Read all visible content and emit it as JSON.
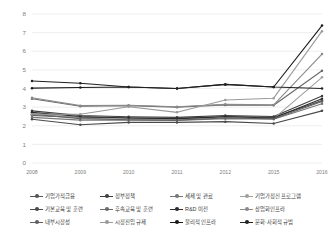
{
  "chart_data": {
    "type": "line",
    "title": "",
    "subtitle": "",
    "xlabel": "",
    "ylabel": "",
    "x": [
      "2008",
      "2009",
      "2010",
      "2011",
      "2012",
      "2015",
      "2016"
    ],
    "categories": [
      "2008",
      "2009",
      "2010",
      "2011",
      "2012",
      "2015",
      "2016"
    ],
    "ylim": [
      0,
      8
    ],
    "yticks": [
      0,
      1,
      2,
      3,
      4,
      5,
      6,
      7,
      8
    ],
    "ytick_labels": [
      "0",
      "1",
      "2",
      "3",
      "4",
      "5",
      "6",
      "7",
      "8"
    ],
    "grid": true,
    "grid_axis": "y",
    "legend_position": "bottom",
    "legend_columns": 4,
    "markers": true,
    "series": [
      {
        "name": "기업가적금융",
        "color": "#555555",
        "values": [
          2.55,
          2.45,
          2.42,
          2.38,
          2.5,
          2.45,
          3.35
        ]
      },
      {
        "name": "정부정책",
        "color": "#3f3f3f",
        "values": [
          2.8,
          2.55,
          2.48,
          2.45,
          2.55,
          2.5,
          3.6
        ]
      },
      {
        "name": "세제 및 관료",
        "color": "#777777",
        "values": [
          2.45,
          2.3,
          2.3,
          2.28,
          2.38,
          2.35,
          3.18
        ]
      },
      {
        "name": "기업가정신 프로그램",
        "color": "#a0a0a0",
        "values": [
          2.65,
          2.42,
          2.35,
          2.35,
          2.42,
          2.38,
          4.6
        ]
      },
      {
        "name": "기본교육 및 훈련",
        "color": "#4a4a4a",
        "values": [
          2.35,
          2.05,
          2.18,
          2.18,
          2.22,
          2.12,
          2.8
        ]
      },
      {
        "name": "후속교육 및 훈련",
        "color": "#6a6a6a",
        "values": [
          3.45,
          3.05,
          3.08,
          3.0,
          3.12,
          3.1,
          4.95
        ]
      },
      {
        "name": "R&D 이전",
        "color": "#2b2b2b",
        "values": [
          2.72,
          2.5,
          2.42,
          2.38,
          2.48,
          2.42,
          3.45
        ]
      },
      {
        "name": "상업화인프라",
        "color": "#8a8a8a",
        "values": [
          3.5,
          3.08,
          3.1,
          3.02,
          3.15,
          3.12,
          5.85
        ]
      },
      {
        "name": "내부시장성",
        "color": "#606060",
        "values": [
          2.62,
          2.38,
          2.32,
          2.3,
          2.42,
          2.38,
          3.3
        ]
      },
      {
        "name": "시장진입 규제",
        "color": "#9a9a9a",
        "values": [
          2.62,
          2.62,
          3.02,
          2.72,
          3.38,
          3.48,
          7.08
        ]
      },
      {
        "name": "물리적 인프라",
        "color": "#1a1a1a",
        "values": [
          4.02,
          4.05,
          4.08,
          4.0,
          4.22,
          4.08,
          7.38
        ]
      },
      {
        "name": "문화·사회적 규범",
        "color": "#222222",
        "values": [
          4.4,
          4.28,
          4.08,
          4.0,
          4.22,
          4.08,
          4.0
        ]
      }
    ]
  },
  "legend": {
    "rows": [
      [
        {
          "label": "기업가적금융",
          "color": "#555555"
        },
        {
          "label": "정부정책",
          "color": "#3f3f3f"
        },
        {
          "label": "세제 및 관료",
          "color": "#777777"
        },
        {
          "label": "기업가정신 프로그램",
          "color": "#a0a0a0"
        }
      ],
      [
        {
          "label": "기본교육 및 훈련",
          "color": "#4a4a4a"
        },
        {
          "label": "후속교육 및 훈련",
          "color": "#6a6a6a"
        },
        {
          "label": "R&D 이전",
          "color": "#2b2b2b"
        },
        {
          "label": "상업화인프라",
          "color": "#8a8a8a"
        }
      ],
      [
        {
          "label": "내부시장성",
          "color": "#606060"
        },
        {
          "label": "시장진입 규제",
          "color": "#9a9a9a"
        },
        {
          "label": "물리적 인프라",
          "color": "#1a1a1a"
        },
        {
          "label": "문화·사회적 규범",
          "color": "#222222"
        }
      ]
    ]
  },
  "style": {
    "grid_color": "#e2e2e2",
    "axis_label_color": "#808080",
    "background": "#ffffff"
  }
}
